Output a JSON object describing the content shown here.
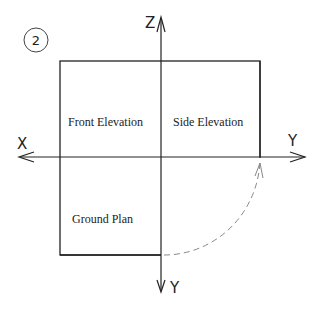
{
  "figure": {
    "badge": "2",
    "regions": {
      "front_elevation": "Front Elevation",
      "side_elevation": "Side Elevation",
      "ground_plan": "Ground Plan"
    },
    "axes": {
      "up": "Z",
      "left": "X",
      "right": "Y",
      "down": "Y"
    },
    "colors": {
      "line": "#222222",
      "dashed": "#888888",
      "background": "#ffffff"
    }
  }
}
